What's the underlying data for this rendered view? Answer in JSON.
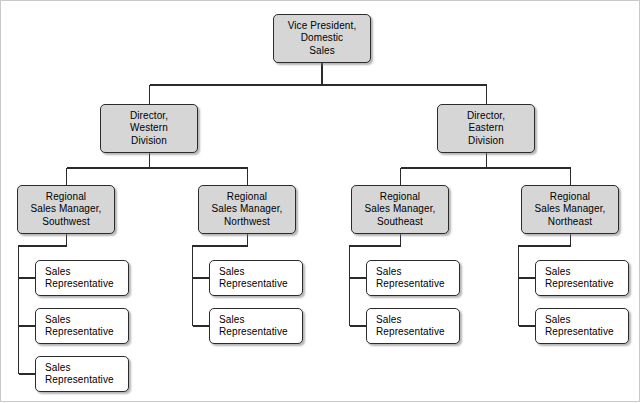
{
  "chart_data": {
    "type": "diagram",
    "orientation": "top-down",
    "levels": 4,
    "node_fill_filled": "#d6d6d6",
    "node_fill_plain": "#ffffff",
    "node_border": "#2b2b2b",
    "connector_color": "#2b2b2b",
    "background": "#ffffff",
    "nodes": [
      {
        "id": "vp",
        "level": 1,
        "lines": [
          "Vice President,",
          "Domestic",
          "Sales"
        ],
        "style": "filled",
        "align": "center",
        "x": 273,
        "y": 14,
        "w": 98,
        "h": 49
      },
      {
        "id": "dir-west",
        "level": 2,
        "lines": [
          "Director,",
          "Western",
          "Division"
        ],
        "style": "filled",
        "align": "center",
        "x": 100,
        "y": 104,
        "w": 98,
        "h": 49
      },
      {
        "id": "dir-east",
        "level": 2,
        "lines": [
          "Director,",
          "Eastern",
          "Division"
        ],
        "style": "filled",
        "align": "center",
        "x": 437,
        "y": 104,
        "w": 98,
        "h": 49
      },
      {
        "id": "rsm-sw",
        "level": 3,
        "lines": [
          "Regional",
          "Sales Manager,",
          "Southwest"
        ],
        "style": "filled",
        "align": "center",
        "x": 17,
        "y": 185,
        "w": 98,
        "h": 49
      },
      {
        "id": "rsm-nw",
        "level": 3,
        "lines": [
          "Regional",
          "Sales Manager,",
          "Northwest"
        ],
        "style": "filled",
        "align": "center",
        "x": 198,
        "y": 185,
        "w": 98,
        "h": 49
      },
      {
        "id": "rsm-se",
        "level": 3,
        "lines": [
          "Regional",
          "Sales Manager,",
          "Southeast"
        ],
        "style": "filled",
        "align": "center",
        "x": 351,
        "y": 185,
        "w": 98,
        "h": 49
      },
      {
        "id": "rsm-ne",
        "level": 3,
        "lines": [
          "Regional",
          "Sales Manager,",
          "Northeast"
        ],
        "style": "filled",
        "align": "center",
        "x": 521,
        "y": 185,
        "w": 98,
        "h": 49
      },
      {
        "id": "rep-sw-1",
        "level": 4,
        "lines": [
          "Sales",
          "Representative"
        ],
        "style": "plain",
        "align": "left",
        "x": 35,
        "y": 260,
        "w": 94,
        "h": 36
      },
      {
        "id": "rep-sw-2",
        "level": 4,
        "lines": [
          "Sales",
          "Representative"
        ],
        "style": "plain",
        "align": "left",
        "x": 35,
        "y": 308,
        "w": 94,
        "h": 36
      },
      {
        "id": "rep-sw-3",
        "level": 4,
        "lines": [
          "Sales",
          "Representative"
        ],
        "style": "plain",
        "align": "left",
        "x": 35,
        "y": 356,
        "w": 94,
        "h": 36
      },
      {
        "id": "rep-nw-1",
        "level": 4,
        "lines": [
          "Sales",
          "Representative"
        ],
        "style": "plain",
        "align": "left",
        "x": 209,
        "y": 260,
        "w": 94,
        "h": 36
      },
      {
        "id": "rep-nw-2",
        "level": 4,
        "lines": [
          "Sales",
          "Representative"
        ],
        "style": "plain",
        "align": "left",
        "x": 209,
        "y": 308,
        "w": 94,
        "h": 36
      },
      {
        "id": "rep-se-1",
        "level": 4,
        "lines": [
          "Sales",
          "Representative"
        ],
        "style": "plain",
        "align": "left",
        "x": 366,
        "y": 260,
        "w": 94,
        "h": 36
      },
      {
        "id": "rep-se-2",
        "level": 4,
        "lines": [
          "Sales",
          "Representative"
        ],
        "style": "plain",
        "align": "left",
        "x": 366,
        "y": 308,
        "w": 94,
        "h": 36
      },
      {
        "id": "rep-ne-1",
        "level": 4,
        "lines": [
          "Sales",
          "Representative"
        ],
        "style": "plain",
        "align": "left",
        "x": 535,
        "y": 260,
        "w": 94,
        "h": 36
      },
      {
        "id": "rep-ne-2",
        "level": 4,
        "lines": [
          "Sales",
          "Representative"
        ],
        "style": "plain",
        "align": "left",
        "x": 535,
        "y": 308,
        "w": 94,
        "h": 36
      }
    ],
    "edges": [
      {
        "from": "vp",
        "to": "dir-west"
      },
      {
        "from": "vp",
        "to": "dir-east"
      },
      {
        "from": "dir-west",
        "to": "rsm-sw"
      },
      {
        "from": "dir-west",
        "to": "rsm-nw"
      },
      {
        "from": "dir-east",
        "to": "rsm-se"
      },
      {
        "from": "dir-east",
        "to": "rsm-ne"
      },
      {
        "from": "rsm-sw",
        "to": "rep-sw-1"
      },
      {
        "from": "rsm-sw",
        "to": "rep-sw-2"
      },
      {
        "from": "rsm-sw",
        "to": "rep-sw-3"
      },
      {
        "from": "rsm-nw",
        "to": "rep-nw-1"
      },
      {
        "from": "rsm-nw",
        "to": "rep-nw-2"
      },
      {
        "from": "rsm-se",
        "to": "rep-se-1"
      },
      {
        "from": "rsm-se",
        "to": "rep-se-2"
      },
      {
        "from": "rsm-ne",
        "to": "rep-ne-1"
      },
      {
        "from": "rsm-ne",
        "to": "rep-ne-2"
      }
    ]
  }
}
